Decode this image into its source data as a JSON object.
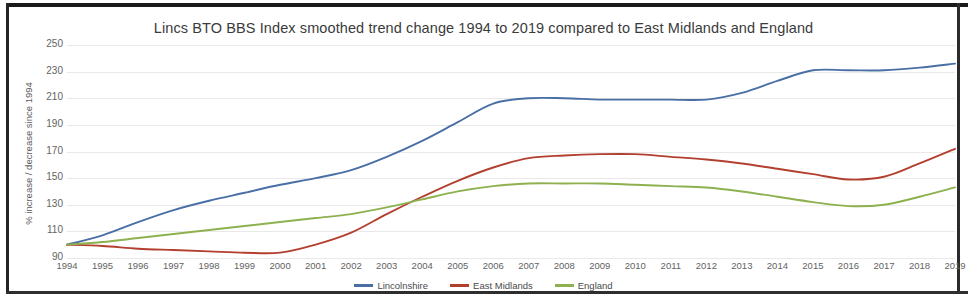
{
  "chart_data": {
    "type": "line",
    "title": "Lincs BTO BBS Index smoothed trend change 1994 to 2019 compared to East Midlands and England",
    "xlabel": "",
    "ylabel": "% increase / decrease since 1994",
    "ylim": [
      90,
      250
    ],
    "yticks": [
      90,
      110,
      130,
      150,
      170,
      190,
      210,
      230,
      250
    ],
    "grid": true,
    "legend_position": "bottom",
    "categories": [
      1994,
      1995,
      1996,
      1997,
      1998,
      1999,
      2000,
      2001,
      2002,
      2003,
      2004,
      2005,
      2006,
      2007,
      2008,
      2009,
      2010,
      2011,
      2012,
      2013,
      2014,
      2015,
      2016,
      2017,
      2018,
      2019
    ],
    "series": [
      {
        "name": "Lincolnshire",
        "color": "#4a6fa5",
        "values": [
          100,
          107,
          117,
          126,
          133,
          139,
          145,
          150,
          156,
          166,
          178,
          192,
          206,
          210,
          210,
          209,
          209,
          209,
          209,
          214,
          223,
          231,
          231,
          231,
          233,
          236
        ]
      },
      {
        "name": "East Midlands",
        "color": "#b3402f",
        "values": [
          100,
          99,
          97,
          96,
          95,
          94,
          94,
          100,
          109,
          123,
          136,
          148,
          158,
          165,
          167,
          168,
          168,
          166,
          164,
          161,
          157,
          153,
          149,
          151,
          161,
          172
        ]
      },
      {
        "name": "England",
        "color": "#8db14e",
        "values": [
          100,
          102,
          105,
          108,
          111,
          114,
          117,
          120,
          123,
          128,
          134,
          140,
          144,
          146,
          146,
          146,
          145,
          144,
          143,
          140,
          136,
          132,
          129,
          130,
          136,
          143
        ]
      }
    ]
  },
  "axis": {
    "y_title": "% increase / decrease since 1994"
  },
  "legend": {
    "items": [
      {
        "label": "Lincolnshire",
        "color": "#4a6fa5"
      },
      {
        "label": "East Midlands",
        "color": "#b3402f"
      },
      {
        "label": "England",
        "color": "#8db14e"
      }
    ]
  }
}
